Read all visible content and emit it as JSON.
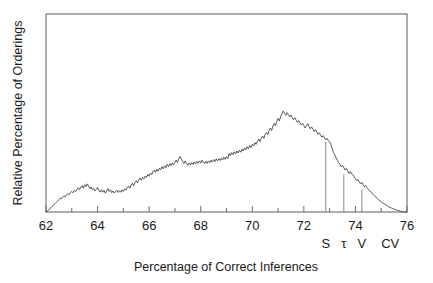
{
  "chart_data": {
    "type": "line",
    "title": "",
    "subtitle": "",
    "xlabel": "Percentage of Correct Inferences",
    "ylabel": "Relative Percentage of Orderings",
    "xlim": [
      62,
      76
    ],
    "ylim": [
      0,
      1.0
    ],
    "grid": false,
    "legend_position": "none",
    "x_major_ticks": [
      62,
      64,
      66,
      68,
      70,
      72,
      74,
      76
    ],
    "x_major_tick_labels": [
      "62",
      "64",
      "66",
      "68",
      "70",
      "72",
      "74",
      "76"
    ],
    "x_minor_ticks": [
      63,
      65,
      67,
      69,
      71,
      73,
      75
    ],
    "y_ticks": [],
    "y_tick_labels": [],
    "annotations": [
      {
        "label": "S",
        "x": 72.85,
        "y": 0.355
      },
      {
        "label": "τ",
        "x": 73.55,
        "y": 0.19
      },
      {
        "label": "V",
        "x": 74.25,
        "y": 0.115
      },
      {
        "label": "CV",
        "x": 75.35,
        "y": 0.0
      }
    ],
    "series": [
      {
        "name": "Relative percentage of orderings",
        "color": "#3a3a3a",
        "x": [
          62.0,
          62.05,
          62.1,
          62.15,
          62.2,
          62.25,
          62.3,
          62.35,
          62.4,
          62.45,
          62.5,
          62.55,
          62.6,
          62.65,
          62.7,
          62.75,
          62.8,
          62.85,
          62.9,
          62.95,
          63.0,
          63.05,
          63.1,
          63.15,
          63.2,
          63.25,
          63.3,
          63.35,
          63.4,
          63.45,
          63.5,
          63.55,
          63.6,
          63.65,
          63.7,
          63.75,
          63.8,
          63.85,
          63.9,
          63.95,
          64.0,
          64.05,
          64.1,
          64.15,
          64.2,
          64.25,
          64.3,
          64.35,
          64.4,
          64.45,
          64.5,
          64.55,
          64.6,
          64.65,
          64.7,
          64.75,
          64.8,
          64.85,
          64.9,
          64.95,
          65.0,
          65.05,
          65.1,
          65.15,
          65.2,
          65.25,
          65.3,
          65.35,
          65.4,
          65.45,
          65.5,
          65.55,
          65.6,
          65.65,
          65.7,
          65.75,
          65.8,
          65.85,
          65.9,
          65.95,
          66.0,
          66.05,
          66.1,
          66.15,
          66.2,
          66.25,
          66.3,
          66.35,
          66.4,
          66.45,
          66.5,
          66.55,
          66.6,
          66.65,
          66.7,
          66.75,
          66.8,
          66.85,
          66.9,
          66.95,
          67.0,
          67.05,
          67.1,
          67.15,
          67.2,
          67.25,
          67.3,
          67.35,
          67.4,
          67.45,
          67.5,
          67.55,
          67.6,
          67.65,
          67.7,
          67.75,
          67.8,
          67.85,
          67.9,
          67.95,
          68.0,
          68.05,
          68.1,
          68.15,
          68.2,
          68.25,
          68.3,
          68.35,
          68.4,
          68.45,
          68.5,
          68.55,
          68.6,
          68.65,
          68.7,
          68.75,
          68.8,
          68.85,
          68.9,
          68.95,
          69.0,
          69.05,
          69.1,
          69.15,
          69.2,
          69.25,
          69.3,
          69.35,
          69.4,
          69.45,
          69.5,
          69.55,
          69.6,
          69.65,
          69.7,
          69.75,
          69.8,
          69.85,
          69.9,
          69.95,
          70.0,
          70.05,
          70.1,
          70.15,
          70.2,
          70.25,
          70.3,
          70.35,
          70.4,
          70.45,
          70.5,
          70.55,
          70.6,
          70.65,
          70.7,
          70.75,
          70.8,
          70.85,
          70.9,
          70.95,
          71.0,
          71.05,
          71.1,
          71.15,
          71.2,
          71.25,
          71.3,
          71.35,
          71.4,
          71.45,
          71.5,
          71.55,
          71.6,
          71.65,
          71.7,
          71.75,
          71.8,
          71.85,
          71.9,
          71.95,
          72.0,
          72.05,
          72.1,
          72.15,
          72.2,
          72.25,
          72.3,
          72.35,
          72.4,
          72.45,
          72.5,
          72.55,
          72.6,
          72.65,
          72.7,
          72.75,
          72.8,
          72.85,
          72.9,
          72.95,
          73.0,
          73.05,
          73.1,
          73.15,
          73.2,
          73.25,
          73.3,
          73.35,
          73.4,
          73.45,
          73.5,
          73.55,
          73.6,
          73.65,
          73.7,
          73.75,
          73.8,
          73.85,
          73.9,
          73.95,
          74.0,
          74.05,
          74.1,
          74.15,
          74.2,
          74.25,
          74.3,
          74.35,
          74.4,
          74.45,
          74.5,
          74.55,
          74.6,
          74.65,
          74.7,
          74.75,
          74.8,
          74.85,
          74.9,
          74.95,
          75.0,
          75.05,
          75.1,
          75.15,
          75.2,
          75.25,
          75.3,
          75.35,
          75.4,
          75.45,
          75.5,
          75.55,
          75.6,
          75.65,
          75.7,
          75.75,
          75.8,
          75.85,
          75.9,
          76.0
        ],
        "y": [
          0.0,
          0.004,
          0.01,
          0.018,
          0.022,
          0.03,
          0.036,
          0.042,
          0.049,
          0.055,
          0.062,
          0.07,
          0.066,
          0.075,
          0.082,
          0.077,
          0.086,
          0.093,
          0.088,
          0.098,
          0.104,
          0.097,
          0.11,
          0.103,
          0.115,
          0.122,
          0.112,
          0.126,
          0.133,
          0.12,
          0.138,
          0.128,
          0.142,
          0.131,
          0.118,
          0.127,
          0.113,
          0.12,
          0.106,
          0.113,
          0.124,
          0.11,
          0.101,
          0.113,
          0.1,
          0.11,
          0.095,
          0.107,
          0.118,
          0.104,
          0.112,
          0.098,
          0.106,
          0.096,
          0.104,
          0.11,
          0.099,
          0.108,
          0.1,
          0.112,
          0.104,
          0.117,
          0.11,
          0.124,
          0.131,
          0.12,
          0.136,
          0.145,
          0.133,
          0.148,
          0.158,
          0.147,
          0.162,
          0.172,
          0.16,
          0.175,
          0.168,
          0.182,
          0.174,
          0.19,
          0.181,
          0.196,
          0.188,
          0.204,
          0.212,
          0.2,
          0.216,
          0.206,
          0.222,
          0.214,
          0.229,
          0.218,
          0.233,
          0.224,
          0.24,
          0.229,
          0.244,
          0.234,
          0.248,
          0.238,
          0.252,
          0.262,
          0.25,
          0.268,
          0.281,
          0.268,
          0.255,
          0.245,
          0.258,
          0.246,
          0.236,
          0.248,
          0.238,
          0.25,
          0.24,
          0.252,
          0.243,
          0.256,
          0.246,
          0.258,
          0.248,
          0.262,
          0.252,
          0.244,
          0.256,
          0.246,
          0.258,
          0.249,
          0.262,
          0.252,
          0.265,
          0.255,
          0.268,
          0.258,
          0.27,
          0.26,
          0.272,
          0.263,
          0.276,
          0.266,
          0.279,
          0.27,
          0.296,
          0.284,
          0.3,
          0.29,
          0.304,
          0.294,
          0.308,
          0.298,
          0.312,
          0.302,
          0.318,
          0.308,
          0.324,
          0.314,
          0.33,
          0.32,
          0.336,
          0.326,
          0.342,
          0.334,
          0.35,
          0.342,
          0.358,
          0.368,
          0.356,
          0.374,
          0.384,
          0.372,
          0.392,
          0.402,
          0.39,
          0.41,
          0.424,
          0.412,
          0.434,
          0.448,
          0.436,
          0.458,
          0.472,
          0.46,
          0.482,
          0.496,
          0.51,
          0.498,
          0.488,
          0.502,
          0.492,
          0.48,
          0.49,
          0.478,
          0.466,
          0.476,
          0.464,
          0.452,
          0.462,
          0.45,
          0.44,
          0.448,
          0.436,
          0.424,
          0.434,
          0.446,
          0.432,
          0.42,
          0.43,
          0.418,
          0.406,
          0.416,
          0.404,
          0.392,
          0.4,
          0.388,
          0.378,
          0.386,
          0.374,
          0.364,
          0.372,
          0.36,
          0.355,
          0.34,
          0.318,
          0.3,
          0.288,
          0.274,
          0.262,
          0.25,
          0.24,
          0.228,
          0.236,
          0.224,
          0.212,
          0.22,
          0.208,
          0.196,
          0.204,
          0.192,
          0.19,
          0.178,
          0.168,
          0.158,
          0.164,
          0.152,
          0.142,
          0.15,
          0.138,
          0.128,
          0.134,
          0.122,
          0.115,
          0.108,
          0.1,
          0.094,
          0.086,
          0.08,
          0.074,
          0.068,
          0.062,
          0.056,
          0.051,
          0.046,
          0.042,
          0.038,
          0.034,
          0.03,
          0.026,
          0.023,
          0.02,
          0.017,
          0.014,
          0.012,
          0.01,
          0.008,
          0.006,
          0.004,
          0.002,
          0.001,
          0.0,
          0.0
        ]
      }
    ]
  }
}
